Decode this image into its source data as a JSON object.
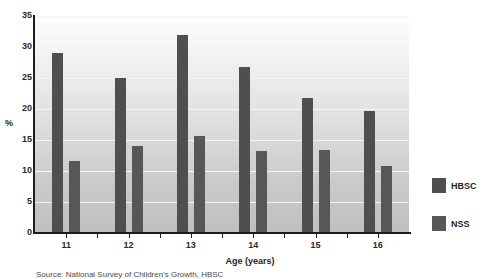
{
  "chart_data": {
    "type": "bar",
    "title": "",
    "xlabel": "Age (years)",
    "ylabel": "%",
    "categories": [
      "11",
      "12",
      "13",
      "14",
      "15",
      "16"
    ],
    "series": [
      {
        "name": "HBSC",
        "color": "#4f4f4f",
        "values": [
          29.0,
          25.0,
          32.0,
          26.7,
          21.7,
          19.7
        ]
      },
      {
        "name": "NSS",
        "color": "#575757",
        "values": [
          11.6,
          14.0,
          15.6,
          13.2,
          13.4,
          10.8
        ]
      }
    ],
    "ylim": [
      0,
      35
    ],
    "yticks": [
      0,
      5,
      10,
      15,
      20,
      25,
      30,
      35
    ],
    "ytick_labels": [
      "0",
      "5",
      "10",
      "15",
      "20",
      "25",
      "30",
      "35"
    ],
    "grid": true,
    "legend_position": "right"
  },
  "legend": {
    "items": [
      {
        "label": "HBSC",
        "color": "#4f4f4f"
      },
      {
        "label": "NSS",
        "color": "#575757"
      }
    ]
  },
  "axes": {
    "y_title": "%",
    "x_title": "Age (years)"
  },
  "caption": {
    "source": "Source: National Survey of Children's Growth, HBSC"
  }
}
